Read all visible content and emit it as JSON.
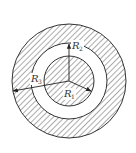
{
  "diagram": {
    "type": "concentric-cylinders-cross-section",
    "center": {
      "x": 69,
      "y": 81
    },
    "outer_ring_outer_radius": 57,
    "outer_ring_inner_radius": 38,
    "inner_core_radius": 25,
    "colors": {
      "stroke": "#333333",
      "hatch": "#444444",
      "background": "#ffffff"
    },
    "labels": {
      "r1": {
        "main": "R",
        "sub": "1"
      },
      "r2": {
        "main": "R",
        "sub": "2"
      },
      "r3": {
        "main": "R",
        "sub": "3"
      }
    }
  }
}
